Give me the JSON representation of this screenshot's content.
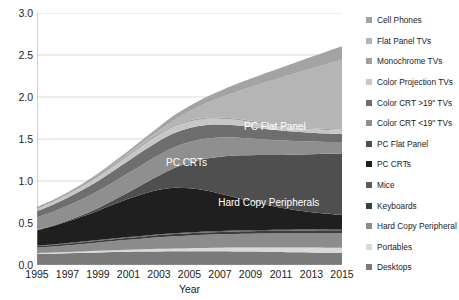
{
  "chart_data": {
    "type": "area",
    "stacked": true,
    "title": "",
    "xlabel": "Year",
    "ylabel": "Million metric tons",
    "grid": true,
    "legend_position": "right",
    "xlim": [
      1995,
      2015
    ],
    "ylim": [
      0.0,
      3.0
    ],
    "ytick_labels": [
      "0.0",
      "0.5",
      "1.0",
      "1.5",
      "2.0",
      "2.5",
      "3.0"
    ],
    "ytick_values": [
      0.0,
      0.5,
      1.0,
      1.5,
      2.0,
      2.5,
      3.0
    ],
    "xtick_labels": [
      "1995",
      "1997",
      "1999",
      "2001",
      "2003",
      "2005",
      "2007",
      "2009",
      "2011",
      "2013",
      "2015"
    ],
    "xtick_values": [
      1995,
      1997,
      1999,
      2001,
      2003,
      2005,
      2007,
      2009,
      2011,
      2013,
      2015
    ],
    "x": [
      1995,
      1996,
      1997,
      1998,
      1999,
      2000,
      2001,
      2002,
      2003,
      2004,
      2005,
      2006,
      2007,
      2008,
      2009,
      2010,
      2011,
      2012,
      2013,
      2014,
      2015
    ],
    "stack_order_top_to_bottom": [
      "Cell Phones",
      "Flat Panel TVs",
      "Monochrome TVs",
      "Color Projection TVs",
      "Color CRT >19\" TVs",
      "Color CRT <19\" TVs",
      "PC Flat Panel",
      "PC CRTs",
      "Mice",
      "Keyboards",
      "Hard Copy Peripheral",
      "Portables",
      "Desktops"
    ],
    "series": [
      {
        "name": "Desktops",
        "color": "#7a7a7a",
        "values": [
          0.13,
          0.135,
          0.14,
          0.145,
          0.15,
          0.155,
          0.158,
          0.16,
          0.162,
          0.163,
          0.164,
          0.164,
          0.163,
          0.162,
          0.16,
          0.158,
          0.155,
          0.152,
          0.15,
          0.147,
          0.145
        ]
      },
      {
        "name": "Portables",
        "color": "#d9d9d9",
        "values": [
          0.012,
          0.013,
          0.015,
          0.017,
          0.019,
          0.022,
          0.024,
          0.027,
          0.03,
          0.033,
          0.036,
          0.039,
          0.042,
          0.045,
          0.048,
          0.05,
          0.053,
          0.055,
          0.057,
          0.059,
          0.06
        ]
      },
      {
        "name": "Hard Copy Peripheral",
        "color": "#8c8c8c",
        "values": [
          0.065,
          0.072,
          0.08,
          0.089,
          0.098,
          0.108,
          0.118,
          0.128,
          0.138,
          0.146,
          0.152,
          0.157,
          0.16,
          0.163,
          0.165,
          0.167,
          0.169,
          0.171,
          0.173,
          0.175,
          0.177
        ]
      },
      {
        "name": "Keyboards",
        "color": "#3d3d3d",
        "values": [
          0.018,
          0.019,
          0.02,
          0.021,
          0.022,
          0.023,
          0.024,
          0.025,
          0.026,
          0.027,
          0.027,
          0.028,
          0.028,
          0.029,
          0.029,
          0.03,
          0.03,
          0.031,
          0.031,
          0.032,
          0.032
        ]
      },
      {
        "name": "Mice",
        "color": "#5c5c5c",
        "values": [
          0.006,
          0.006,
          0.007,
          0.007,
          0.008,
          0.008,
          0.009,
          0.009,
          0.01,
          0.01,
          0.01,
          0.011,
          0.011,
          0.011,
          0.012,
          0.012,
          0.012,
          0.013,
          0.013,
          0.013,
          0.014
        ]
      },
      {
        "name": "PC CRTs",
        "color": "#1f1f1f",
        "values": [
          0.18,
          0.215,
          0.255,
          0.3,
          0.35,
          0.405,
          0.455,
          0.5,
          0.53,
          0.54,
          0.525,
          0.49,
          0.445,
          0.395,
          0.345,
          0.3,
          0.262,
          0.23,
          0.205,
          0.185,
          0.17
        ]
      },
      {
        "name": "PC Flat Panel",
        "color": "#4f4f4f",
        "values": [
          0.005,
          0.008,
          0.013,
          0.02,
          0.032,
          0.05,
          0.078,
          0.118,
          0.17,
          0.235,
          0.305,
          0.375,
          0.44,
          0.498,
          0.548,
          0.592,
          0.63,
          0.663,
          0.69,
          0.712,
          0.73
        ]
      },
      {
        "name": "Color CRT <19\" TVs",
        "color": "#8f8f8f",
        "values": [
          0.15,
          0.162,
          0.175,
          0.188,
          0.202,
          0.215,
          0.228,
          0.238,
          0.245,
          0.248,
          0.245,
          0.238,
          0.228,
          0.215,
          0.2,
          0.186,
          0.172,
          0.16,
          0.15,
          0.142,
          0.135
        ]
      },
      {
        "name": "Color CRT >19\" TVs",
        "color": "#6e6e6e",
        "values": [
          0.075,
          0.085,
          0.096,
          0.108,
          0.12,
          0.133,
          0.146,
          0.157,
          0.165,
          0.169,
          0.168,
          0.163,
          0.155,
          0.146,
          0.136,
          0.127,
          0.118,
          0.111,
          0.105,
          0.1,
          0.096
        ]
      },
      {
        "name": "Color Projection TVs",
        "color": "#c7c7c7",
        "values": [
          0.03,
          0.034,
          0.039,
          0.045,
          0.051,
          0.058,
          0.065,
          0.071,
          0.076,
          0.078,
          0.077,
          0.074,
          0.07,
          0.065,
          0.06,
          0.055,
          0.051,
          0.047,
          0.044,
          0.042,
          0.04
        ]
      },
      {
        "name": "Monochrome TVs",
        "color": "#9e9e9e",
        "values": [
          0.018,
          0.018,
          0.018,
          0.018,
          0.018,
          0.018,
          0.017,
          0.017,
          0.016,
          0.016,
          0.015,
          0.015,
          0.014,
          0.014,
          0.013,
          0.013,
          0.012,
          0.012,
          0.011,
          0.011,
          0.01
        ]
      },
      {
        "name": "Flat Panel TVs",
        "color": "#b5b5b5",
        "values": [
          0.0,
          0.0,
          0.001,
          0.001,
          0.002,
          0.004,
          0.008,
          0.016,
          0.032,
          0.062,
          0.105,
          0.165,
          0.235,
          0.315,
          0.4,
          0.485,
          0.565,
          0.64,
          0.71,
          0.775,
          0.835
        ]
      },
      {
        "name": "Cell Phones",
        "color": "#a3a3a3",
        "values": [
          0.003,
          0.005,
          0.008,
          0.012,
          0.017,
          0.023,
          0.03,
          0.038,
          0.046,
          0.055,
          0.063,
          0.072,
          0.081,
          0.09,
          0.1,
          0.11,
          0.12,
          0.13,
          0.14,
          0.15,
          0.16
        ]
      }
    ],
    "totals": [
      0.692,
      0.772,
      0.867,
      0.971,
      1.089,
      1.222,
      1.36,
      1.504,
      1.646,
      1.782,
      1.892,
      1.891,
      1.872,
      1.848,
      2.216,
      2.285,
      2.349,
      2.415,
      2.479,
      2.543,
      2.604
    ],
    "annotations": [
      {
        "text": "PC CRTs",
        "x_pct": 49,
        "y_pct": 59
      },
      {
        "text": "PC Flat Panel",
        "x_pct": 78,
        "y_pct": 45
      },
      {
        "text": "Hard Copy Peripherals",
        "x_pct": 76,
        "y_pct": 75
      }
    ]
  },
  "legend": {
    "items": [
      {
        "label": "Cell Phones",
        "color": "#a3a3a3"
      },
      {
        "label": "Flat Panel TVs",
        "color": "#b5b5b5"
      },
      {
        "label": "Monochrome TVs",
        "color": "#9e9e9e"
      },
      {
        "label": "Color Projection TVs",
        "color": "#c7c7c7"
      },
      {
        "label": "Color CRT >19\" TVs",
        "color": "#6e6e6e"
      },
      {
        "label": "Color CRT <19\" TVs",
        "color": "#8f8f8f"
      },
      {
        "label": "PC Flat Panel",
        "color": "#4f4f4f"
      },
      {
        "label": "PC CRTs",
        "color": "#1f1f1f"
      },
      {
        "label": "Mice",
        "color": "#5c5c5c"
      },
      {
        "label": "Keyboards",
        "color": "#3d3d3d"
      },
      {
        "label": "Hard Copy Peripheral",
        "color": "#8c8c8c"
      },
      {
        "label": "Portables",
        "color": "#d9d9d9"
      },
      {
        "label": "Desktops",
        "color": "#7a7a7a"
      }
    ]
  },
  "style": {
    "grid_color": "#c8c8c8",
    "axis_color": "#9a9a9a",
    "text_color": "#222222",
    "background": "#ffffff"
  }
}
